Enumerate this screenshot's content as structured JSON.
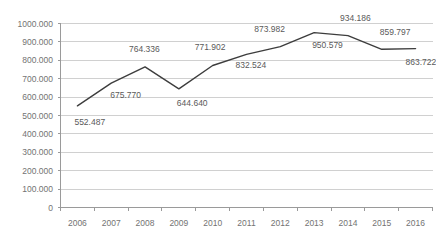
{
  "chart_data": {
    "type": "line",
    "title": "",
    "subtitle": "",
    "xlabel": "",
    "ylabel": "",
    "categories": [
      "2006",
      "2007",
      "2008",
      "2009",
      "2010",
      "2011",
      "2012",
      "2013",
      "2014",
      "2015",
      "2016"
    ],
    "values": [
      552487,
      675770,
      764336,
      644640,
      771902,
      832524,
      873982,
      950579,
      934186,
      859797,
      863722
    ],
    "data_labels": [
      "552.487",
      "675.770",
      "764.336",
      "644.640",
      "771.902",
      "832.524",
      "873.982",
      "950.579",
      "934.186",
      "859.797",
      "863.722"
    ],
    "ylim": [
      0,
      1000000
    ],
    "y_ticks": [
      0,
      100000,
      200000,
      300000,
      400000,
      500000,
      600000,
      700000,
      800000,
      900000,
      1000000
    ],
    "y_tick_labels": [
      "0",
      "100.000",
      "200.000",
      "300.000",
      "400.000",
      "500.000",
      "600.000",
      "700.000",
      "800.000",
      "900.000",
      "1000.000"
    ],
    "grid": true,
    "legend": "none",
    "series_color": "#3d3d3d",
    "grid_color": "#d0d0d0",
    "axis_color": "#9a9a9a"
  }
}
